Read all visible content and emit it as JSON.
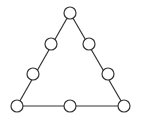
{
  "diagram": {
    "colors": {
      "stroke": "#333333",
      "fill": "#ffffff",
      "background": "#ffffff"
    },
    "node_radius": 6,
    "nodes": [
      {
        "id": "top",
        "x": 70,
        "y": 13
      },
      {
        "id": "left-upper",
        "x": 51,
        "y": 44
      },
      {
        "id": "right-upper",
        "x": 89,
        "y": 44
      },
      {
        "id": "left-lower",
        "x": 33,
        "y": 74
      },
      {
        "id": "right-lower",
        "x": 108,
        "y": 74
      },
      {
        "id": "bottom-left",
        "x": 17,
        "y": 106
      },
      {
        "id": "bottom-middle",
        "x": 70,
        "y": 106
      },
      {
        "id": "bottom-right",
        "x": 124,
        "y": 106
      }
    ],
    "edges": [
      [
        "top",
        "bottom-left"
      ],
      [
        "top",
        "bottom-right"
      ],
      [
        "bottom-left",
        "bottom-right"
      ]
    ]
  }
}
